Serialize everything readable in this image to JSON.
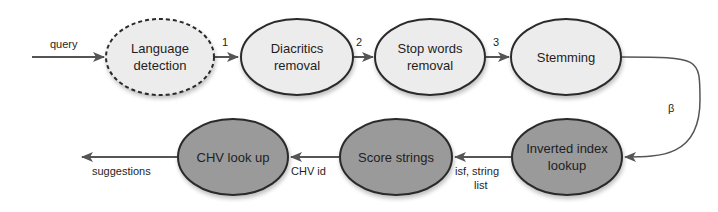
{
  "diagram": {
    "colors": {
      "light_fill": "#ececec",
      "dark_fill": "#9a9a9a",
      "stroke": "#2a2a2a",
      "edge": "#555555"
    },
    "nodes": [
      {
        "id": "lang",
        "line1": "Language",
        "line2": "detection",
        "style": "dashed-light"
      },
      {
        "id": "diac",
        "line1": "Diacritics",
        "line2": "removal",
        "style": "solid-light"
      },
      {
        "id": "stop",
        "line1": "Stop words",
        "line2": "removal",
        "style": "solid-light"
      },
      {
        "id": "stem",
        "line1": "Stemming",
        "line2": "",
        "style": "solid-light"
      },
      {
        "id": "inv",
        "line1": "Inverted index",
        "line2": "lookup",
        "style": "solid-dark"
      },
      {
        "id": "score",
        "line1": "Score strings",
        "line2": "",
        "style": "solid-dark"
      },
      {
        "id": "chv",
        "line1": "CHV look up",
        "line2": "",
        "style": "solid-dark"
      }
    ],
    "edges": [
      {
        "from": "input",
        "to": "lang",
        "label": "query"
      },
      {
        "from": "lang",
        "to": "diac",
        "label": "1"
      },
      {
        "from": "diac",
        "to": "stop",
        "label": "2"
      },
      {
        "from": "stop",
        "to": "stem",
        "label": "3"
      },
      {
        "from": "stem",
        "to": "inv",
        "label": "β"
      },
      {
        "from": "inv",
        "to": "score",
        "label_line1": "isf, string",
        "label_line2": "list"
      },
      {
        "from": "score",
        "to": "chv",
        "label": "CHV id"
      },
      {
        "from": "chv",
        "to": "output",
        "label": "suggestions"
      }
    ]
  }
}
